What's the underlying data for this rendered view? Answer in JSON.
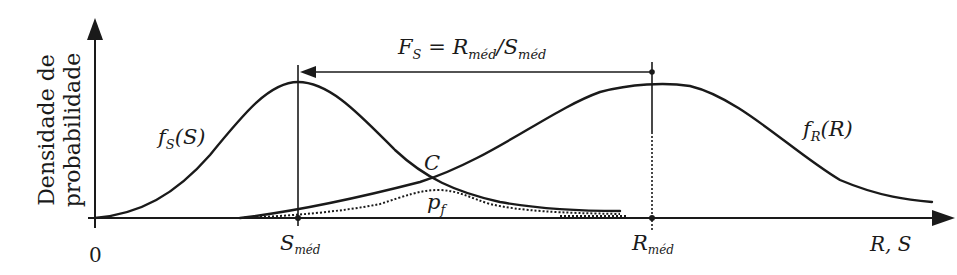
{
  "axes": {
    "y_label_line1": "Densidade de",
    "y_label_line2": "probabilidade",
    "x_label": "R, S",
    "origin": "0"
  },
  "markers": {
    "s_med": {
      "main": "S",
      "sub": "méd"
    },
    "r_med": {
      "main": "R",
      "sub": "méd"
    }
  },
  "annotation": {
    "fs_main": "F",
    "fs_sub": "S",
    "equals": " = ",
    "r_main": "R",
    "r_sub": "méd",
    "slash": "/",
    "s_main": "S",
    "s_sub": "méd"
  },
  "curves": {
    "stress": {
      "f": "f",
      "sub": "S",
      "arg": "(S)"
    },
    "resistance": {
      "f": "f",
      "sub": "R",
      "arg": "(R)"
    }
  },
  "labels": {
    "intersection": "C",
    "failure_prob_main": "p",
    "failure_prob_sub": "f"
  },
  "colors": {
    "ink": "#1a1a1a",
    "background": "#ffffff"
  }
}
